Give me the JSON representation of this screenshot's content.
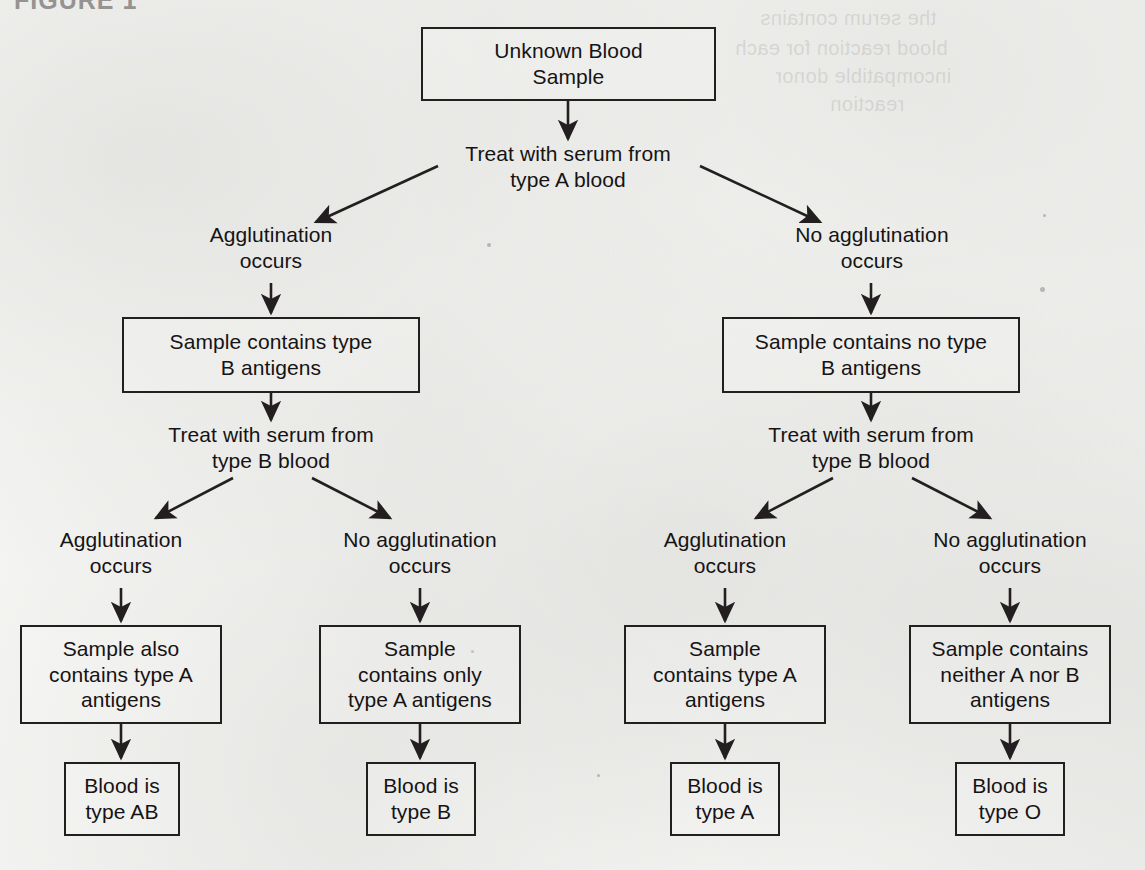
{
  "figure": {
    "header": "FIGURE 1"
  },
  "ghost": {
    "top_right_line1": "the serum contains",
    "top_right_line2": "blood reaction for each",
    "top_right_line3": "incompatible donor",
    "top_right_line4": "reaction"
  },
  "nodes": {
    "start": "Unknown Blood\nSample",
    "test_a": "Treat with serum from\ntype A blood",
    "branch_a_yes": "Agglutination\noccurs",
    "branch_a_no": "No agglutination\noccurs",
    "has_b_antigens": "Sample contains type\nB antigens",
    "no_b_antigens": "Sample contains no type\nB antigens",
    "test_b_left": "Treat with serum from\ntype B blood",
    "test_b_right": "Treat with serum from\ntype B blood",
    "branch_b1_yes": "Agglutination\noccurs",
    "branch_b1_no": "No agglutination\noccurs",
    "branch_b2_yes": "Agglutination\noccurs",
    "branch_b2_no": "No agglutination\noccurs",
    "result_ab_antigens": "Sample also\ncontains type A\nantigens",
    "result_b_antigens": "Sample\ncontains only\ntype A antigens",
    "result_a_antigens": "Sample\ncontains type A\nantigens",
    "result_o_antigens": "Sample contains\nneither A nor B\nantigens",
    "blood_ab": "Blood is\ntype AB",
    "blood_b": "Blood is\ntype B",
    "blood_a": "Blood is\ntype A",
    "blood_o": "Blood is\ntype O"
  },
  "colors": {
    "ink": "#231f20",
    "paper": "#f4f4f2",
    "text": "#161314"
  }
}
